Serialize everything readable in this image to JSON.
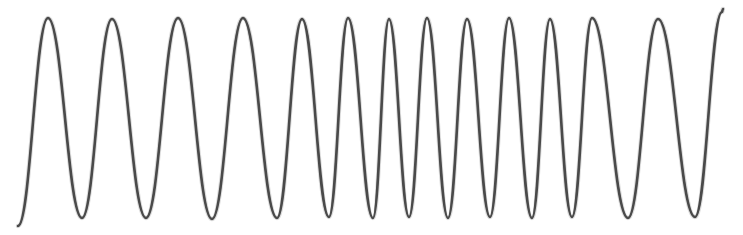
{
  "figure": {
    "name": "oscillating-waveform",
    "background_color": "#ffffff",
    "stroke_color": "#4a4a4a",
    "halo_color": "#8d8d8d",
    "stroke_width": 2.6,
    "width": 743,
    "height": 235
  },
  "chart_data": {
    "type": "line",
    "title": "",
    "subtitle": "",
    "xlabel": "",
    "ylabel": "",
    "grid": false,
    "legend": null,
    "axes_visible": false,
    "tick_labels_x": [],
    "tick_labels_y": [],
    "xlim": [
      0,
      743
    ],
    "ylim": [
      235,
      0
    ],
    "amplitude_px": 100,
    "baseline_y_px": 118,
    "peak_y_px": 18,
    "trough_y_px": 218,
    "cycle_count": 14,
    "start_point": [
      18,
      226
    ],
    "end_point": [
      723,
      9
    ],
    "peaks_x": [
      48,
      112,
      178,
      243,
      302,
      348,
      389,
      427,
      467,
      509,
      550,
      592,
      658,
      722
    ],
    "troughs_x": [
      18,
      82,
      146,
      212,
      277,
      329,
      373,
      409,
      448,
      490,
      532,
      572,
      628,
      695
    ],
    "series": [
      {
        "name": "waveform",
        "color": "#4a4a4a",
        "control_nodes": [
          [
            18,
            226
          ],
          [
            48,
            18
          ],
          [
            82,
            218
          ],
          [
            112,
            19
          ],
          [
            146,
            218
          ],
          [
            178,
            18
          ],
          [
            212,
            219
          ],
          [
            243,
            18
          ],
          [
            277,
            218
          ],
          [
            302,
            19
          ],
          [
            329,
            217
          ],
          [
            348,
            18
          ],
          [
            373,
            218
          ],
          [
            389,
            19
          ],
          [
            409,
            217
          ],
          [
            427,
            18
          ],
          [
            448,
            218
          ],
          [
            467,
            19
          ],
          [
            490,
            217
          ],
          [
            509,
            18
          ],
          [
            532,
            218
          ],
          [
            550,
            19
          ],
          [
            572,
            217
          ],
          [
            592,
            18
          ],
          [
            628,
            218
          ],
          [
            658,
            19
          ],
          [
            695,
            217
          ],
          [
            722,
            12
          ],
          [
            723,
            9
          ]
        ]
      }
    ]
  }
}
